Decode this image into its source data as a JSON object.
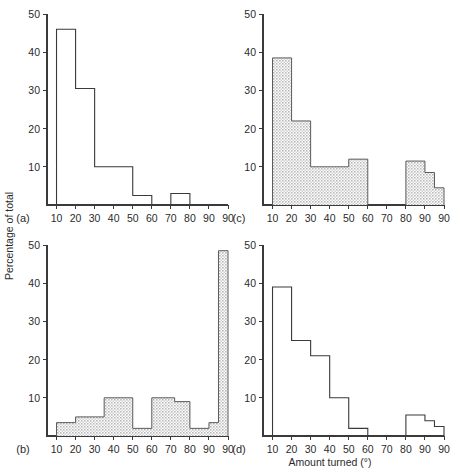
{
  "figure": {
    "axis_titles": {
      "y": "Percentage of total",
      "x": "Amount turned (°)"
    },
    "y_ticks": [
      10,
      20,
      30,
      40,
      50
    ],
    "y_tick_labels": [
      "10",
      "20",
      "30",
      "40",
      "50"
    ],
    "x_tick_labels": [
      "10",
      "20",
      "30",
      "40",
      "50",
      "60",
      "70",
      "80",
      "90",
      "90"
    ],
    "x_tick_values": [
      10,
      20,
      30,
      40,
      50,
      60,
      70,
      80,
      90,
      100
    ],
    "fill_color": "#d9d9d9",
    "line_color": "#3a3a3a"
  },
  "chart_data": [
    {
      "id": "a",
      "type": "bar",
      "panel_label": "(a)",
      "filled": false,
      "title": "",
      "xlabel": "Amount turned (°)",
      "ylabel": "Percentage of total",
      "xlim": [
        5,
        100
      ],
      "ylim": [
        0,
        50
      ],
      "grid": false,
      "bins": [
        {
          "x0": 10,
          "x1": 20,
          "value": 46
        },
        {
          "x0": 20,
          "x1": 30,
          "value": 30.5
        },
        {
          "x0": 30,
          "x1": 50,
          "value": 10
        },
        {
          "x0": 50,
          "x1": 60,
          "value": 2.5
        },
        {
          "x0": 70,
          "x1": 80,
          "value": 3
        }
      ]
    },
    {
      "id": "c",
      "type": "bar",
      "panel_label": "(c)",
      "filled": true,
      "title": "",
      "xlabel": "Amount turned (°)",
      "ylabel": "Percentage of total",
      "xlim": [
        5,
        100
      ],
      "ylim": [
        0,
        50
      ],
      "grid": false,
      "bins": [
        {
          "x0": 10,
          "x1": 20,
          "value": 38.5
        },
        {
          "x0": 20,
          "x1": 30,
          "value": 22
        },
        {
          "x0": 30,
          "x1": 50,
          "value": 10
        },
        {
          "x0": 50,
          "x1": 60,
          "value": 12
        },
        {
          "x0": 80,
          "x1": 90,
          "value": 11.5
        },
        {
          "x0": 90,
          "x1": 95,
          "value": 8.5
        },
        {
          "x0": 95,
          "x1": 100,
          "value": 4.5
        }
      ]
    },
    {
      "id": "b",
      "type": "bar",
      "panel_label": "(b)",
      "filled": true,
      "title": "",
      "xlabel": "Amount turned (°)",
      "ylabel": "Percentage of total",
      "xlim": [
        5,
        100
      ],
      "ylim": [
        0,
        50
      ],
      "grid": false,
      "bins": [
        {
          "x0": 10,
          "x1": 20,
          "value": 3.5
        },
        {
          "x0": 20,
          "x1": 35,
          "value": 5
        },
        {
          "x0": 35,
          "x1": 50,
          "value": 10
        },
        {
          "x0": 50,
          "x1": 60,
          "value": 2
        },
        {
          "x0": 60,
          "x1": 72,
          "value": 10
        },
        {
          "x0": 72,
          "x1": 80,
          "value": 9
        },
        {
          "x0": 80,
          "x1": 90,
          "value": 2
        },
        {
          "x0": 90,
          "x1": 95,
          "value": 3.5
        },
        {
          "x0": 95,
          "x1": 100,
          "value": 48.5
        }
      ]
    },
    {
      "id": "d",
      "type": "bar",
      "panel_label": "(d)",
      "filled": false,
      "title": "",
      "xlabel": "Amount turned (°)",
      "ylabel": "Percentage of total",
      "xlim": [
        5,
        100
      ],
      "ylim": [
        0,
        50
      ],
      "grid": false,
      "bins": [
        {
          "x0": 10,
          "x1": 20,
          "value": 39
        },
        {
          "x0": 20,
          "x1": 30,
          "value": 25
        },
        {
          "x0": 30,
          "x1": 40,
          "value": 21
        },
        {
          "x0": 40,
          "x1": 50,
          "value": 10
        },
        {
          "x0": 50,
          "x1": 60,
          "value": 2
        },
        {
          "x0": 80,
          "x1": 90,
          "value": 5.5
        },
        {
          "x0": 90,
          "x1": 95,
          "value": 4
        },
        {
          "x0": 95,
          "x1": 100,
          "value": 2.5
        }
      ]
    }
  ]
}
